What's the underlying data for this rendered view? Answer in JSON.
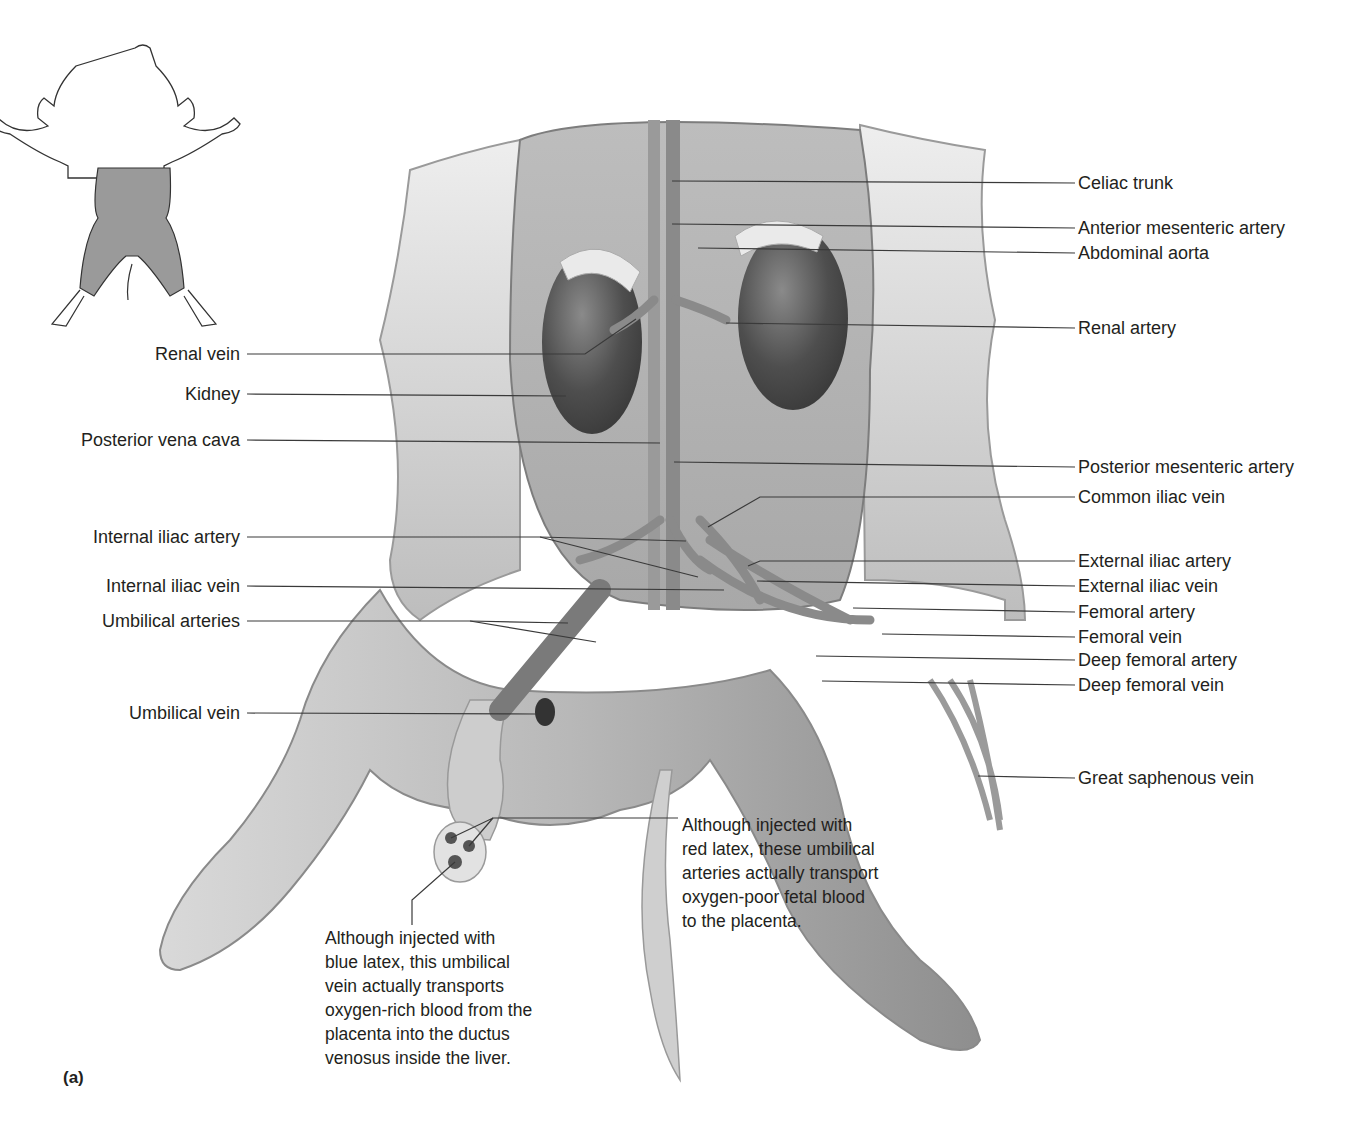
{
  "figure": {
    "panel_label": "(a)",
    "orientation_inset": {
      "description": "Outline of fetal pig with shaded abdominal/hindlimb region indicating area shown",
      "shade_color": "#9a9a9a"
    }
  },
  "labels": {
    "right": [
      {
        "id": "celiac-trunk",
        "text": "Celiac trunk",
        "x": 1078,
        "y": 183,
        "target": [
          672,
          181
        ]
      },
      {
        "id": "anterior-mesenteric-artery",
        "text": "Anterior mesenteric artery",
        "x": 1078,
        "y": 228,
        "target": [
          672,
          224
        ]
      },
      {
        "id": "abdominal-aorta",
        "text": "Abdominal aorta",
        "x": 1078,
        "y": 253,
        "target": [
          698,
          248
        ]
      },
      {
        "id": "renal-artery",
        "text": "Renal artery",
        "x": 1078,
        "y": 328,
        "target": [
          726,
          323
        ]
      },
      {
        "id": "posterior-mesenteric-artery",
        "text": "Posterior mesenteric artery",
        "x": 1078,
        "y": 467,
        "target": [
          674,
          462
        ]
      },
      {
        "id": "common-iliac-vein",
        "text": "Common iliac vein",
        "x": 1078,
        "y": 497,
        "target": [
          708,
          527
        ],
        "elbow": [
          760,
          493
        ]
      },
      {
        "id": "external-iliac-artery",
        "text": "External iliac artery",
        "x": 1078,
        "y": 561,
        "target": [
          748,
          566
        ],
        "elbow": [
          760,
          557
        ]
      },
      {
        "id": "external-iliac-vein",
        "text": "External iliac vein",
        "x": 1078,
        "y": 586,
        "target": [
          757,
          581
        ]
      },
      {
        "id": "femoral-artery",
        "text": "Femoral artery",
        "x": 1078,
        "y": 612,
        "target": [
          853,
          608
        ]
      },
      {
        "id": "femoral-vein",
        "text": "Femoral vein",
        "x": 1078,
        "y": 637,
        "target": [
          882,
          634
        ]
      },
      {
        "id": "deep-femoral-artery",
        "text": "Deep femoral artery",
        "x": 1078,
        "y": 660,
        "target": [
          816,
          656
        ]
      },
      {
        "id": "deep-femoral-vein",
        "text": "Deep femoral vein",
        "x": 1078,
        "y": 685,
        "target": [
          822,
          681
        ]
      },
      {
        "id": "great-saphenous-vein",
        "text": "Great saphenous vein",
        "x": 1078,
        "y": 778,
        "target": [
          978,
          776
        ]
      }
    ],
    "left": [
      {
        "id": "renal-vein",
        "text": "Renal vein",
        "x": 244,
        "y": 354,
        "target": [
          636,
          319
        ],
        "elbow": [
          585,
          354
        ]
      },
      {
        "id": "kidney",
        "text": "Kidney",
        "x": 244,
        "y": 394,
        "target": [
          566,
          396
        ]
      },
      {
        "id": "posterior-vena-cava",
        "text": "Posterior vena cava",
        "x": 244,
        "y": 440,
        "target": [
          660,
          443
        ]
      },
      {
        "id": "internal-iliac-artery",
        "text": "Internal iliac artery",
        "x": 244,
        "y": 537,
        "target": [
          686,
          541
        ],
        "target2": [
          698,
          577
        ],
        "elbow": [
          540,
          537
        ]
      },
      {
        "id": "internal-iliac-vein",
        "text": "Internal iliac vein",
        "x": 244,
        "y": 586,
        "target": [
          724,
          590
        ]
      },
      {
        "id": "umbilical-arteries",
        "text": "Umbilical arteries",
        "x": 244,
        "y": 621,
        "target": [
          568,
          623
        ],
        "target2": [
          596,
          642
        ],
        "elbow": [
          470,
          621
        ]
      },
      {
        "id": "umbilical-vein",
        "text": "Umbilical vein",
        "x": 244,
        "y": 713,
        "target": [
          536,
          714
        ]
      }
    ]
  },
  "annotations": [
    {
      "id": "red-latex-note",
      "x": 682,
      "y": 813,
      "text": "Although injected with\nred latex, these umbilical\narteries actually transport\noxygen-poor fetal blood\nto the placenta."
    },
    {
      "id": "blue-latex-note",
      "x": 325,
      "y": 926,
      "text": "Although injected with\nblue latex, this umbilical\nvein actually transports\noxygen-rich blood from the\nplacenta into the ductus\nvenosus inside the liver."
    }
  ],
  "colors": {
    "text": "#231f20",
    "leader": "#3a3a3a",
    "skin": "#c9c9c9",
    "organ_dark": "#4a4a4a",
    "vessel": "#8c8c8c"
  }
}
